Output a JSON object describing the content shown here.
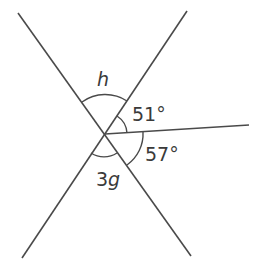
{
  "diagram": {
    "type": "intersecting-lines-angles",
    "labels": {
      "h": "h",
      "a51": "51°",
      "a57": "57°",
      "g3": "3",
      "g3_var": "g"
    },
    "angles": [
      {
        "name": "h",
        "description": "angle between upper-left and upper-right rays"
      },
      {
        "name": "51°",
        "value_deg": 51,
        "description": "angle between upper-right ray and horizontal-right ray"
      },
      {
        "name": "57°",
        "value_deg": 57,
        "description": "angle between horizontal-right ray and lower-right ray"
      },
      {
        "name": "3g",
        "description": "angle between lower-left and lower-right rays"
      }
    ],
    "stroke_color": "#4a4a4a"
  }
}
